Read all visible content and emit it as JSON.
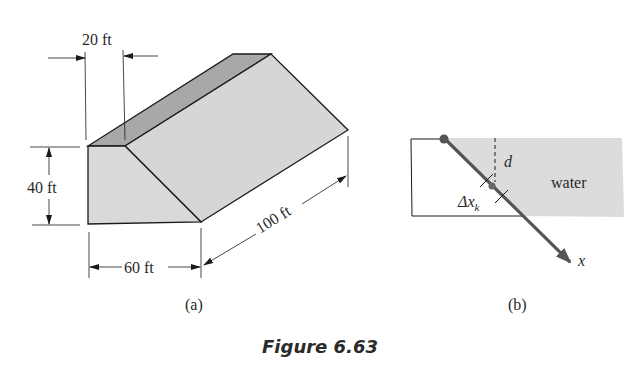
{
  "figure": {
    "caption": "Figure 6.63",
    "colors": {
      "front_face": "#d9d9d9",
      "top_face": "#a8a8a8",
      "slope_face": "#d6d6d6",
      "water": "#dcdcdc",
      "line": "#1a1a1a",
      "arrow": "#555555"
    },
    "panel_a": {
      "label": "(a)",
      "dimensions": {
        "top_width": "20 ft",
        "height": "40 ft",
        "bottom_width": "60 ft",
        "length": "100 ft"
      }
    },
    "panel_b": {
      "label": "(b)",
      "water_label": "water",
      "depth_label": "d",
      "delta_label": "Δx",
      "delta_subscript": "k",
      "axis_label": "x"
    }
  }
}
